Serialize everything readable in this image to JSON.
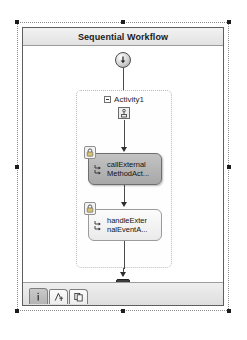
{
  "designer": {
    "title": "Sequential Workflow",
    "colors": {
      "title_bar": "#e9e9e9",
      "selected_activity": "#b5b5b5",
      "normal_activity": "#f4f4f4",
      "line": "#4a4a4a",
      "handle": "#1c1c1c"
    },
    "start_node": {
      "name": "start-node",
      "icon": "circle-down-arrow-icon"
    },
    "end_node": {
      "name": "end-node",
      "icon": "filled-circle-square-icon"
    },
    "composite": {
      "label": "Activity1",
      "expander_state": "expanded",
      "expander_glyph": "minus-box-icon",
      "icon": "sequence-activity-icon"
    },
    "activities": [
      {
        "name": "callExternalMethodActivity",
        "line1": "callExternal",
        "line2": "MethodAct...",
        "icon": "call-external-method-icon",
        "badge": "lock-icon",
        "selected": true
      },
      {
        "name": "handleExternalEventActivity",
        "line1": "handleExter",
        "line2": "nalEventA...",
        "icon": "handle-external-event-icon",
        "badge": "lock-icon",
        "selected": false
      }
    ],
    "footer_tabs": [
      {
        "name": "tab-properties",
        "icon": "properties-icon",
        "active": true
      },
      {
        "name": "tab-cancel-handler",
        "icon": "cancel-handler-icon",
        "active": false
      },
      {
        "name": "tab-fault-handler",
        "icon": "fault-handler-icon",
        "active": false
      }
    ],
    "selection_handles": [
      "top-left",
      "top-center",
      "top-right",
      "middle-left",
      "middle-right",
      "bottom-left",
      "bottom-center",
      "bottom-right"
    ]
  }
}
